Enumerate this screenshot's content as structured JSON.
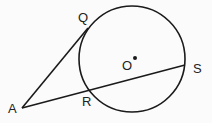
{
  "diagram": {
    "colors": {
      "stroke": "#1a1a1a",
      "background": "#fbfbfb"
    },
    "circle": {
      "label": "O",
      "cx": 132,
      "cy": 59,
      "r": 53
    },
    "points": {
      "A": {
        "label": "A",
        "x": 22,
        "y": 108
      },
      "Q": {
        "label": "Q",
        "x": 88,
        "y": 28
      },
      "R": {
        "label": "R",
        "x": 87,
        "y": 87
      },
      "S": {
        "label": "S",
        "x": 185,
        "y": 65
      },
      "O": {
        "label": "O",
        "x": 135,
        "y": 58
      }
    },
    "segments": [
      {
        "name": "AQ",
        "from": "A",
        "to": "Q",
        "type": "tangent"
      },
      {
        "name": "AS",
        "from": "A",
        "to": "S",
        "type": "secant"
      }
    ]
  }
}
